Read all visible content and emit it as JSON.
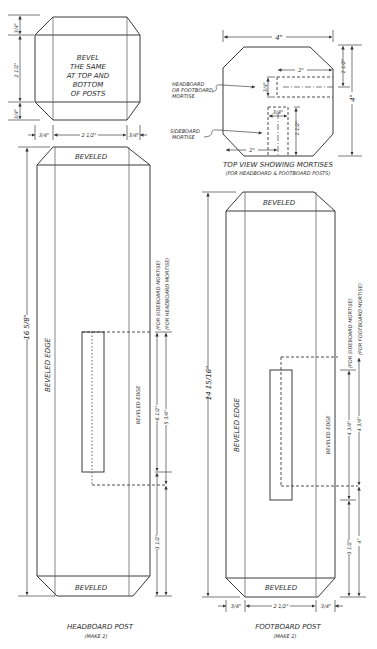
{
  "top_bevel_detail": {
    "note_lines": [
      "BEVEL",
      "THE SAME",
      "AT TOP AND",
      "BOTTOM",
      "OF POSTS"
    ],
    "dim_top": "3/4\"",
    "dim_middle": "2 1/2\"",
    "dim_bottom": "3/4\"",
    "dim_width_left": "3/4\"",
    "dim_width_center": "2 1/2\"",
    "dim_width_right": "3/4\""
  },
  "top_view": {
    "title": "TOP VIEW SHOWING MORTISES",
    "subtitle": "(FOR HEADBOARD & FOOTBOARD POSTS)",
    "dim_width": "4\"",
    "dim_height": "4\"",
    "dim_offset_top": "1 1/2\"",
    "dim_mortise_length_top": "2\"",
    "dim_mortise_width_top": "3/4\"",
    "dim_mortise_width_side": "3/4\"",
    "dim_mortise_length_side": "1 1/2\"",
    "dim_offset_side": "2\"",
    "callout_headboard": [
      "HEADBOARD",
      "OR FOOTBOARD",
      "MORTISE"
    ],
    "callout_sideboard": [
      "SIDEBOARD",
      "MORTISE"
    ]
  },
  "headboard_post": {
    "label_top": "BEVELED",
    "label_bottom": "BEVELED",
    "edge_left": "BEVELED EDGE",
    "edge_right": "BEVELED EDGE",
    "dim_total": "16 5/8\"",
    "dim_sideboard_mortise": "6 1/2\"",
    "dim_headboard_mortise": "5 3/4\"",
    "dim_bottom": "3 1/2\"",
    "note_sideboard": "(FOR SIDEBOARD MORTISE)",
    "note_headboard": "(FOR HEADBOARD MORTISE)",
    "caption": "HEADBOARD POST",
    "caption_sub": "(MAKE 2)"
  },
  "footboard_post": {
    "label_top": "BEVELED",
    "label_bottom": "BEVELED",
    "edge_left": "BEVELED EDGE",
    "edge_right": "BEVELED EDGE",
    "dim_total": "14 15/16\"",
    "dim_sideboard_mortise": "4 3/4\"",
    "dim_footboard_mortise": "4 3/4\"",
    "dim_bottom_inner": "3 1/2\"",
    "dim_bottom_outer": "4\"",
    "dim_width_left": "3/4\"",
    "dim_width_center": "2 1/2\"",
    "dim_width_right": "3/4\"",
    "note_sideboard": "(FOR SIDEBOARD MORTISE)",
    "note_footboard": "(FOR FOOTBOARD MORTISE)",
    "caption": "FOOTBOARD POST",
    "caption_sub": "(MAKE 2)"
  }
}
